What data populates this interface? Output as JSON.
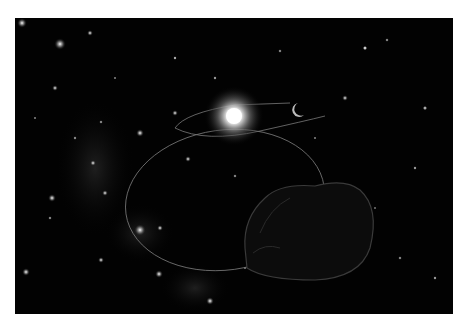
{
  "image": {
    "description": "Space illustration: bright star with orbital paths, small crescent body, and a dark rocky asteroid in the foreground against a starfield with a Milky Way band",
    "colors": {
      "background": "#ffffff",
      "space": "#020202",
      "sun_core": "#ffffff",
      "orbit": "#8a8a8a"
    }
  }
}
